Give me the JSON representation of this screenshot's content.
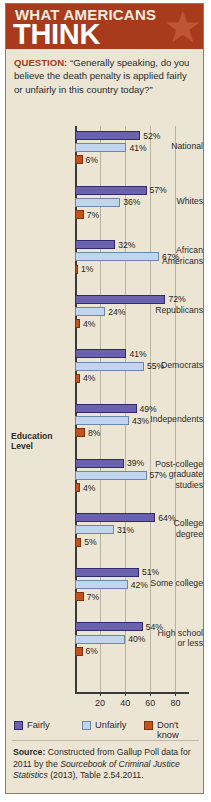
{
  "banner": {
    "line1": "WHAT AMERICANS",
    "line2": "THINK",
    "star_icon": "star-icon",
    "bg_color": "#a73b1c"
  },
  "question": {
    "label": "QUESTION:",
    "text": " “Generally speaking, do you believe the death penalty is applied fairly or unfairly in this country today?”"
  },
  "education_header": {
    "line1": "Education",
    "line2": "Level"
  },
  "legend": {
    "items": [
      {
        "label": "Fairly",
        "color": "#6a62ae"
      },
      {
        "label": "Unfairly",
        "color": "#c2d5ef"
      },
      {
        "label": "Don't know",
        "color": "#c4521d"
      }
    ]
  },
  "source": {
    "label": "Source:",
    "text_1": " Constructed from Gallup Poll data for 2011 by the ",
    "italic_1": "Sourcebook of Criminal Justice Statistics",
    "text_2": " (2013), Table 2.54.2011."
  },
  "chart_data": {
    "type": "bar",
    "orientation": "horizontal",
    "title": "WHAT AMERICANS THINK",
    "subtitle": "Generally speaking, do you believe the death penalty is applied fairly or unfairly in this country today?",
    "xlabel": "",
    "ylabel": "",
    "xlim": [
      0,
      90
    ],
    "xticks": [
      20,
      40,
      60,
      80
    ],
    "grid": true,
    "legend_position": "bottom",
    "units": "percent",
    "categories": [
      "National",
      "Whites",
      "African Americans",
      "Republicans",
      "Democrats",
      "Independents",
      "Post-college graduate studies",
      "College degree",
      "Some college",
      "High school or less"
    ],
    "series": [
      {
        "name": "Fairly",
        "color": "#6a62ae",
        "values": [
          52,
          57,
          32,
          72,
          41,
          49,
          39,
          64,
          51,
          54
        ]
      },
      {
        "name": "Unfairly",
        "color": "#c2d5ef",
        "values": [
          41,
          36,
          67,
          24,
          55,
          43,
          57,
          31,
          42,
          40
        ]
      },
      {
        "name": "Don't know",
        "color": "#c4521d",
        "values": [
          6,
          7,
          1,
          4,
          4,
          8,
          4,
          5,
          7,
          6
        ]
      }
    ],
    "groups": [
      {
        "label_lines": [
          "National"
        ],
        "fairly": 52,
        "unfairly": 41,
        "dont_know": 6,
        "fairly_label": "52%",
        "unfairly_label": "41%",
        "dont_know_label": "6%"
      },
      {
        "label_lines": [
          "Whites"
        ],
        "fairly": 57,
        "unfairly": 36,
        "dont_know": 7,
        "fairly_label": "57%",
        "unfairly_label": "36%",
        "dont_know_label": "7%"
      },
      {
        "label_lines": [
          "African",
          "Americans"
        ],
        "fairly": 32,
        "unfairly": 67,
        "dont_know": 1,
        "fairly_label": "32%",
        "unfairly_label": "67%",
        "dont_know_label": "1%"
      },
      {
        "label_lines": [
          "Republicans"
        ],
        "fairly": 72,
        "unfairly": 24,
        "dont_know": 4,
        "fairly_label": "72%",
        "unfairly_label": "24%",
        "dont_know_label": "4%"
      },
      {
        "label_lines": [
          "Democrats"
        ],
        "fairly": 41,
        "unfairly": 55,
        "dont_know": 4,
        "fairly_label": "41%",
        "unfairly_label": "55%",
        "dont_know_label": "4%"
      },
      {
        "label_lines": [
          "Independents"
        ],
        "fairly": 49,
        "unfairly": 43,
        "dont_know": 8,
        "fairly_label": "49%",
        "unfairly_label": "43%",
        "dont_know_label": "8%"
      },
      {
        "label_lines": [
          "Post-college",
          "graduate",
          "studies"
        ],
        "fairly": 39,
        "unfairly": 57,
        "dont_know": 4,
        "fairly_label": "39%",
        "unfairly_label": "57%",
        "dont_know_label": "4%"
      },
      {
        "label_lines": [
          "College",
          "degree"
        ],
        "fairly": 64,
        "unfairly": 31,
        "dont_know": 5,
        "fairly_label": "64%",
        "unfairly_label": "31%",
        "dont_know_label": "5%"
      },
      {
        "label_lines": [
          "Some college"
        ],
        "fairly": 51,
        "unfairly": 42,
        "dont_know": 7,
        "fairly_label": "51%",
        "unfairly_label": "42%",
        "dont_know_label": "7%"
      },
      {
        "label_lines": [
          "High school",
          "or less"
        ],
        "fairly": 54,
        "unfairly": 40,
        "dont_know": 6,
        "fairly_label": "54%",
        "unfairly_label": "40%",
        "dont_know_label": "6%"
      }
    ]
  }
}
